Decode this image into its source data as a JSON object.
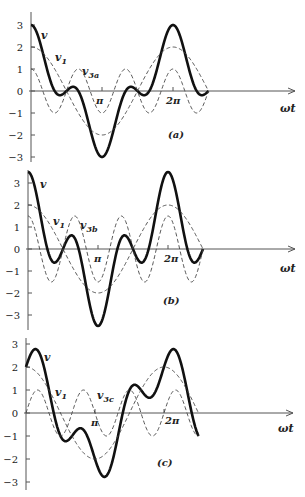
{
  "figure": {
    "x_axis_label": "ωt",
    "y_tick_labels": [
      "3",
      "2",
      "1",
      "0",
      "−1",
      "−2",
      "−3"
    ],
    "x_tick_labels": [
      "π",
      "2π"
    ]
  },
  "chart_data": [
    {
      "type": "line",
      "panel": "(a)",
      "caption": "(a)",
      "xlabel": "ωt",
      "ylim": [
        -3,
        3
      ],
      "x_range_rad": [
        0,
        7.854
      ],
      "series": [
        {
          "name": "v",
          "label": "v",
          "style": "bold",
          "formula": "2cos(x)+cos(3x)"
        },
        {
          "name": "v1",
          "label": "v",
          "sub": "1",
          "style": "dashed",
          "formula": "2cos(x)"
        },
        {
          "name": "v3a",
          "label": "v",
          "sub": "3a",
          "style": "dashed",
          "formula": "cos(3x)"
        }
      ],
      "key_points": {
        "v_at_0": 3,
        "v_at_pi": -3,
        "v_at_2pi": 3
      }
    },
    {
      "type": "line",
      "panel": "(b)",
      "caption": "(b)",
      "xlabel": "ωt",
      "ylim": [
        -3.5,
        3.5
      ],
      "x_range_rad": [
        0,
        7.854
      ],
      "series": [
        {
          "name": "v",
          "label": "v",
          "style": "bold",
          "formula": "2cos(x)+1.5cos(3x)"
        },
        {
          "name": "v1",
          "label": "v",
          "sub": "1",
          "style": "dashed",
          "formula": "2cos(x)"
        },
        {
          "name": "v3b",
          "label": "v",
          "sub": "3b",
          "style": "dashed",
          "formula": "1.5cos(3x)"
        }
      ],
      "key_points": {
        "v_at_0": 3.5,
        "v_at_pi": -3.5,
        "v_at_2pi": 3.5
      }
    },
    {
      "type": "line",
      "panel": "(c)",
      "caption": "(c)",
      "xlabel": "ωt",
      "ylim": [
        -3,
        3
      ],
      "x_range_rad": [
        0,
        7.854
      ],
      "series": [
        {
          "name": "v",
          "label": "v",
          "style": "bold",
          "formula": "2cos(x)+sin(3x)"
        },
        {
          "name": "v1",
          "label": "v",
          "sub": "1",
          "style": "dashed",
          "formula": "2cos(x)"
        },
        {
          "name": "v3c",
          "label": "v",
          "sub": "3c",
          "style": "dashed",
          "formula": "sin(3x)"
        }
      ],
      "key_points": {
        "v_at_0": 2,
        "v_max": 2.73,
        "v_min": -2.73
      }
    }
  ],
  "panels_layout": [
    {
      "ox": 31,
      "oy": 91,
      "ux": 71,
      "uy": 22,
      "ytop": 12,
      "ybot": 162,
      "axis_end": 295,
      "comps": [
        [
          2,
          1,
          0
        ],
        [
          1,
          3,
          0
        ]
      ],
      "ticks": [
        3,
        2,
        1,
        0,
        -1,
        -2,
        -3
      ],
      "caption_pos": [
        168,
        138
      ],
      "labels": {
        "v": [
          41,
          39
        ],
        "v1": [
          55,
          61
        ],
        "v3": [
          82,
          75
        ],
        "pi": [
          96,
          104
        ],
        "twopi": [
          166,
          104
        ],
        "wt": [
          280,
          112
        ]
      }
    },
    {
      "ox": 28,
      "oy": 249,
      "ux": 70,
      "uy": 22,
      "ytop": 170,
      "ybot": 330,
      "axis_end": 295,
      "comps": [
        [
          2,
          1,
          0
        ],
        [
          1.5,
          3,
          0
        ]
      ],
      "ticks": [
        3,
        2,
        1,
        0,
        -1,
        -2,
        -3
      ],
      "caption_pos": [
        163,
        304
      ],
      "labels": {
        "v": [
          40,
          188
        ],
        "v1": [
          53,
          225
        ],
        "v3": [
          80,
          229
        ],
        "pi": [
          94,
          262
        ],
        "twopi": [
          164,
          262
        ],
        "wt": [
          280,
          272
        ]
      }
    },
    {
      "ox": 26,
      "oy": 413,
      "ux": 69,
      "uy": 23,
      "ytop": 338,
      "ybot": 490,
      "axis_end": 293,
      "comps": [
        [
          2,
          1,
          0
        ],
        [
          1,
          3,
          -1.5708
        ]
      ],
      "ticks": [
        3,
        2,
        1,
        0,
        -1,
        -2,
        -3
      ],
      "caption_pos": [
        157,
        466
      ],
      "labels": {
        "v": [
          44,
          361
        ],
        "v1": [
          55,
          396
        ],
        "v3": [
          97,
          399
        ],
        "pi": [
          91,
          426
        ],
        "twopi": [
          165,
          424
        ],
        "wt": [
          278,
          432
        ]
      }
    }
  ]
}
